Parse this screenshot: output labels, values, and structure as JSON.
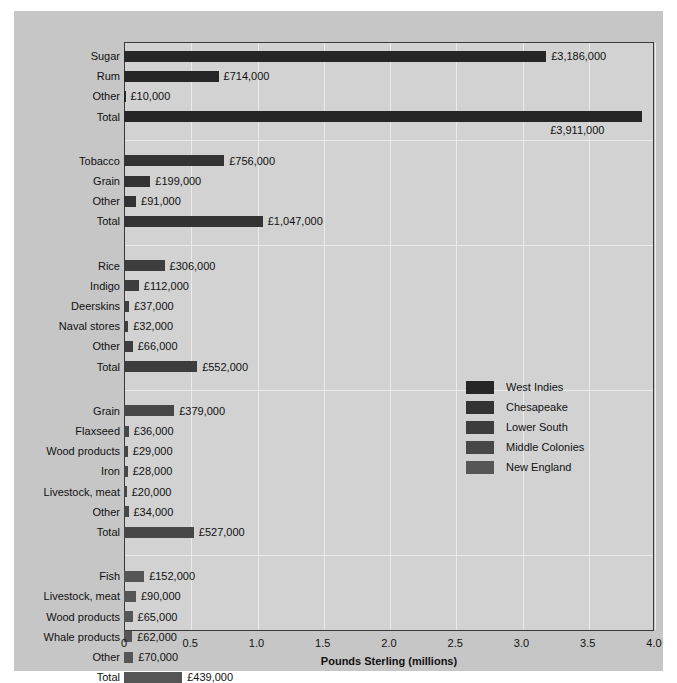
{
  "chart_data": {
    "type": "bar",
    "title": "",
    "xlabel": "Pounds Sterling (millions)",
    "ylabel": "",
    "xlim": [
      0,
      4.0
    ],
    "xticks": [
      "0",
      "0.5",
      "1.0",
      "1.5",
      "2.0",
      "2.5",
      "3.0",
      "3.5",
      "4.0"
    ],
    "xtick_values": [
      0,
      0.5,
      1.0,
      1.5,
      2.0,
      2.5,
      3.0,
      3.5,
      4.0
    ],
    "grid": "vertical",
    "orientation": "horizontal",
    "legend_position": "middle-right",
    "legend": [
      {
        "name": "West Indies",
        "color": "#262626"
      },
      {
        "name": "Chesapeake",
        "color": "#333333"
      },
      {
        "name": "Lower South",
        "color": "#3d3d3d"
      },
      {
        "name": "Middle Colonies",
        "color": "#474747"
      },
      {
        "name": "New England",
        "color": "#555555"
      }
    ],
    "groups": [
      {
        "name": "West Indies",
        "color": "#262626",
        "categories": [
          "Sugar",
          "Rum",
          "Other",
          "Total"
        ],
        "values": [
          3.186,
          0.714,
          0.01,
          3.911
        ],
        "labels": [
          "£3,186,000",
          "£714,000",
          "£10,000",
          "£3,911,000"
        ],
        "label_below": [
          false,
          false,
          false,
          true
        ]
      },
      {
        "name": "Chesapeake",
        "color": "#333333",
        "categories": [
          "Tobacco",
          "Grain",
          "Other",
          "Total"
        ],
        "values": [
          0.756,
          0.199,
          0.091,
          1.047
        ],
        "labels": [
          "£756,000",
          "£199,000",
          "£91,000",
          "£1,047,000"
        ],
        "label_below": [
          false,
          false,
          false,
          false
        ]
      },
      {
        "name": "Lower South",
        "color": "#3d3d3d",
        "categories": [
          "Rice",
          "Indigo",
          "Deerskins",
          "Naval stores",
          "Other",
          "Total"
        ],
        "values": [
          0.306,
          0.112,
          0.037,
          0.032,
          0.066,
          0.552
        ],
        "labels": [
          "£306,000",
          "£112,000",
          "£37,000",
          "£32,000",
          "£66,000",
          "£552,000"
        ],
        "label_below": [
          false,
          false,
          false,
          false,
          false,
          false
        ]
      },
      {
        "name": "Middle Colonies",
        "color": "#474747",
        "categories": [
          "Grain",
          "Flaxseed",
          "Wood products",
          "Iron",
          "Livestock, meat",
          "Other",
          "Total"
        ],
        "values": [
          0.379,
          0.036,
          0.029,
          0.028,
          0.02,
          0.034,
          0.527
        ],
        "labels": [
          "£379,000",
          "£36,000",
          "£29,000",
          "£28,000",
          "£20,000",
          "£34,000",
          "£527,000"
        ],
        "label_below": [
          false,
          false,
          false,
          false,
          false,
          false,
          false
        ]
      },
      {
        "name": "New England",
        "color": "#555555",
        "categories": [
          "Fish",
          "Livestock, meat",
          "Wood products",
          "Whale products",
          "Other",
          "Total"
        ],
        "values": [
          0.152,
          0.09,
          0.065,
          0.062,
          0.07,
          0.439
        ],
        "labels": [
          "£152,000",
          "£90,000",
          "£65,000",
          "£62,000",
          "£70,000",
          "£439,000"
        ],
        "label_below": [
          false,
          false,
          false,
          false,
          false,
          false
        ]
      }
    ]
  },
  "colors": {
    "page_background": "#ffffff",
    "paper_background": "#c6c6c6",
    "plot_background": "#d2d2d2",
    "gridline": "#eceaea",
    "frame": "#3a3a3a",
    "text": "#111111"
  }
}
